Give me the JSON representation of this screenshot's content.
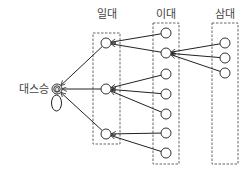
{
  "diagram": {
    "type": "lineage-tree",
    "root": {
      "label": "대스승",
      "symbol": "0",
      "x": 57,
      "y": 89,
      "r": 5,
      "self_loop": true
    },
    "generations": [
      {
        "label": "일대",
        "label_pos": {
          "x": 107,
          "y": 18
        },
        "box": {
          "x": 93,
          "y": 33,
          "w": 27,
          "h": 111
        },
        "nodes": [
          {
            "id": "g1-1",
            "x": 106,
            "y": 43
          },
          {
            "id": "g1-2",
            "x": 106,
            "y": 89
          },
          {
            "id": "g1-3",
            "x": 106,
            "y": 134
          }
        ]
      },
      {
        "label": "이대",
        "label_pos": {
          "x": 166,
          "y": 18
        },
        "box": {
          "x": 153,
          "y": 23,
          "w": 26,
          "h": 141
        },
        "nodes": [
          {
            "id": "g2-1",
            "x": 166,
            "y": 33
          },
          {
            "id": "g2-2",
            "x": 166,
            "y": 53
          },
          {
            "id": "g2-3",
            "x": 166,
            "y": 74
          },
          {
            "id": "g2-4",
            "x": 166,
            "y": 94
          },
          {
            "id": "g2-5",
            "x": 166,
            "y": 114
          },
          {
            "id": "g2-6",
            "x": 166,
            "y": 133
          },
          {
            "id": "g2-7",
            "x": 166,
            "y": 153
          }
        ]
      },
      {
        "label": "삼대",
        "label_pos": {
          "x": 225,
          "y": 18
        },
        "box": {
          "x": 212,
          "y": 23,
          "w": 26,
          "h": 141
        },
        "nodes": [
          {
            "id": "g3-1",
            "x": 225,
            "y": 43
          },
          {
            "id": "g3-2",
            "x": 225,
            "y": 58
          },
          {
            "id": "g3-3",
            "x": 225,
            "y": 73
          }
        ]
      }
    ],
    "edges": [
      {
        "from": "g1-1",
        "to": "root"
      },
      {
        "from": "g1-2",
        "to": "root"
      },
      {
        "from": "g1-3",
        "to": "root"
      },
      {
        "from": "g2-1",
        "to": "g1-1"
      },
      {
        "from": "g2-2",
        "to": "g1-1"
      },
      {
        "from": "g2-3",
        "to": "g1-2"
      },
      {
        "from": "g2-4",
        "to": "g1-2"
      },
      {
        "from": "g2-5",
        "to": "g1-2"
      },
      {
        "from": "g2-6",
        "to": "g1-3"
      },
      {
        "from": "g2-7",
        "to": "g1-3"
      },
      {
        "from": "g3-1",
        "to": "g2-2"
      },
      {
        "from": "g3-2",
        "to": "g2-2"
      },
      {
        "from": "g3-3",
        "to": "g2-2"
      }
    ],
    "node_radius": 5
  }
}
